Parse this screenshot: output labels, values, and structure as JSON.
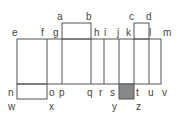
{
  "diagram": {
    "line_color": "#555555",
    "fill_color": "#888888",
    "labels": {
      "a": "a",
      "b": "b",
      "c": "c",
      "d": "d",
      "e": "e",
      "f": "f",
      "g": "g",
      "h": "h",
      "i": "i",
      "j": "j",
      "k": "k",
      "l": "l",
      "m": "m",
      "n": "n",
      "o": "o",
      "p": "p",
      "q": "q",
      "r": "r",
      "s": "s",
      "t": "t",
      "u": "u",
      "v": "v",
      "w": "w",
      "x": "x",
      "y": "y",
      "z": "z"
    }
  }
}
